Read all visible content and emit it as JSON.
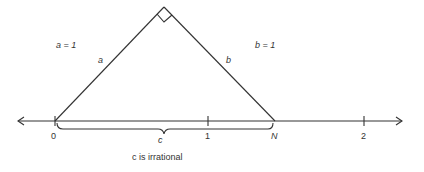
{
  "labels": {
    "a_eq": "a = 1",
    "b_eq": "b = 1",
    "side_a": "a",
    "side_b": "b",
    "brace_c": "c",
    "tick_0": "0",
    "tick_1": "1",
    "tick_2": "2",
    "point_N": "N",
    "caption": "c is irrational"
  }
}
